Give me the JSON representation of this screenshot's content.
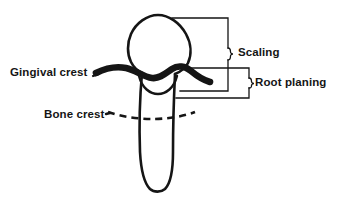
{
  "figure": {
    "type": "dental-anatomy-diagram",
    "background_color": "#ffffff",
    "ink_color": "#151515"
  },
  "labels": {
    "gingival_crest": "Gingival crest",
    "bone_crest": "Bone crest",
    "scaling": "Scaling",
    "root_planing": "Root planing"
  },
  "icons": {
    "tooth": "tooth-outline-icon",
    "gingiva": "gingival-crest-line-icon",
    "bone": "bone-crest-dashed-line-icon",
    "scaling_bracket": "scaling-brace-icon",
    "root_planing_bracket": "root-planing-brace-icon"
  }
}
